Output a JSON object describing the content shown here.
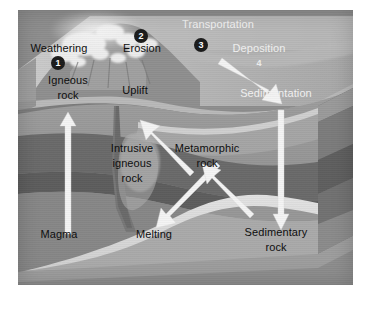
{
  "figure": {
    "frame": {
      "x": 18,
      "y": 10,
      "width": 335,
      "height": 275
    }
  },
  "steps": [
    {
      "id": "1",
      "label": "Weathering",
      "number": "1"
    },
    {
      "id": "2",
      "label": "Erosion",
      "number": "2"
    },
    {
      "id": "3",
      "label": "Transportation",
      "number": "3"
    },
    {
      "id": "4",
      "label": "Deposition",
      "number": "4"
    }
  ],
  "labels": {
    "weathering": "Weathering",
    "erosion": "Erosion",
    "transportation": "Transportation",
    "deposition": "Deposition",
    "sedimentation": "Sedimentation",
    "igneous_rock_1": "Igneous",
    "igneous_rock_2": "rock",
    "uplift": "Uplift",
    "intrusive_1": "Intrusive",
    "intrusive_2": "igneous",
    "intrusive_3": "rock",
    "metamorphic_1": "Metamorphic",
    "metamorphic_2": "rock",
    "magma": "Magma",
    "melting": "Melting",
    "sedimentary_1": "Sedimentary",
    "sedimentary_2": "rock"
  },
  "colors": {
    "background": "#ffffff",
    "surface_top": "#9b9b9b",
    "surface_far": "#b4b4b4",
    "snow": "#efefef",
    "crust_light": "#a3a3a3",
    "crust_mid": "#8a8a8a",
    "crust_dark": "#6d6d6d",
    "crust_darkest": "#5a5a5a",
    "magma_light": "#d6d6d6",
    "sediment_band": "#c9c9c9",
    "arrow": "#f4f4f4",
    "number_badge": "#1b1b1b",
    "label_dark": "#111111",
    "label_light": "#f2f2f2"
  },
  "arrows": [
    {
      "name": "deposition-to-sedimentation",
      "from": [
        205,
        50
      ],
      "to": [
        262,
        88
      ]
    },
    {
      "name": "igneous-rock-uplift",
      "from": [
        50,
        222
      ],
      "to": [
        50,
        110
      ]
    },
    {
      "name": "uplift-arrow",
      "from": [
        175,
        160
      ],
      "to": [
        126,
        112
      ]
    },
    {
      "name": "metamorphic-to-melting",
      "from": [
        200,
        158
      ],
      "to": [
        140,
        214
      ]
    },
    {
      "name": "sedimentary-to-metamorphic",
      "from": [
        232,
        200
      ],
      "to": [
        190,
        160
      ]
    },
    {
      "name": "sedimentation-downward",
      "from": [
        263,
        100
      ],
      "to": [
        263,
        212
      ]
    }
  ]
}
